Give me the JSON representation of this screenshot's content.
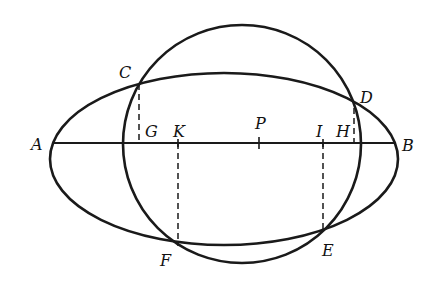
{
  "diagram": {
    "labels": {
      "A": "A",
      "B": "B",
      "C": "C",
      "D": "D",
      "E": "E",
      "F": "F",
      "G": "G",
      "H": "H",
      "I": "I",
      "K": "K",
      "P": "P"
    },
    "colors": {
      "stroke": "#1a1a1a",
      "background": "#ffffff"
    }
  }
}
